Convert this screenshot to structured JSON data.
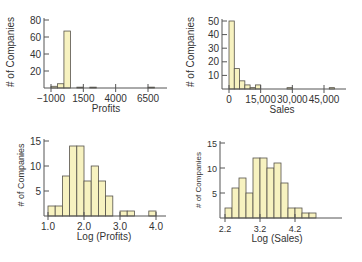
{
  "style": {
    "bar_fill": "#f7f2c0",
    "bar_stroke": "#55524a",
    "axis_color": "#555555",
    "text_color": "#333333"
  },
  "chart_data": [
    {
      "id": "profits",
      "type": "bar",
      "subtype": "histogram",
      "title": "",
      "xlabel": "Profits",
      "ylabel": "# of Companies",
      "xticks": [
        -1000,
        1500,
        4000,
        6500
      ],
      "xtick_labels": [
        "−1000",
        "1500",
        "4000",
        "6500"
      ],
      "yticks": [
        20,
        40,
        60,
        80
      ],
      "ylim": [
        0,
        80
      ],
      "xlim": [
        -1200,
        7300
      ],
      "bin_width": 500,
      "bins": [
        {
          "x0": -1000,
          "x1": -500,
          "count": 2
        },
        {
          "x0": -500,
          "x1": 0,
          "count": 5
        },
        {
          "x0": 0,
          "x1": 500,
          "count": 67
        },
        {
          "x0": 1000,
          "x1": 1500,
          "count": 1
        },
        {
          "x0": 2000,
          "x1": 2500,
          "count": 1
        },
        {
          "x0": 6500,
          "x1": 7000,
          "count": 1
        }
      ],
      "grid": false,
      "legend": "none"
    },
    {
      "id": "sales",
      "type": "bar",
      "subtype": "histogram",
      "title": "",
      "xlabel": "Sales",
      "ylabel": "# of Companies",
      "xticks": [
        0,
        15000,
        30000,
        45000
      ],
      "xtick_labels": [
        "0",
        "15,000",
        "30,000",
        "45,000"
      ],
      "yticks": [
        10,
        20,
        30,
        40,
        50
      ],
      "ylim": [
        0,
        50
      ],
      "xlim": [
        -1500,
        52000
      ],
      "bin_width": 2500,
      "bins": [
        {
          "x0": 0,
          "x1": 2500,
          "count": 50
        },
        {
          "x0": 2500,
          "x1": 5000,
          "count": 15
        },
        {
          "x0": 5000,
          "x1": 7500,
          "count": 6
        },
        {
          "x0": 7500,
          "x1": 10000,
          "count": 3
        },
        {
          "x0": 10000,
          "x1": 12500,
          "count": 1
        },
        {
          "x0": 12500,
          "x1": 15000,
          "count": 3
        },
        {
          "x0": 27500,
          "x1": 30000,
          "count": 1
        },
        {
          "x0": 47500,
          "x1": 50000,
          "count": 1
        }
      ],
      "grid": false,
      "legend": "none"
    },
    {
      "id": "log-profits",
      "type": "bar",
      "subtype": "histogram",
      "title": "",
      "xlabel": "Log (Profits)",
      "ylabel": "# of Companies",
      "xticks": [
        1.0,
        2.0,
        3.0,
        4.0
      ],
      "xtick_labels": [
        "1.0",
        "2.0",
        "3.0",
        "4.0"
      ],
      "yticks": [
        5,
        10,
        15
      ],
      "ylim": [
        0,
        15
      ],
      "xlim": [
        0.9,
        4.1
      ],
      "bin_width": 0.2,
      "bins": [
        {
          "x0": 1.0,
          "x1": 1.2,
          "count": 2
        },
        {
          "x0": 1.2,
          "x1": 1.4,
          "count": 2
        },
        {
          "x0": 1.4,
          "x1": 1.6,
          "count": 8
        },
        {
          "x0": 1.6,
          "x1": 1.8,
          "count": 14
        },
        {
          "x0": 1.8,
          "x1": 2.0,
          "count": 14
        },
        {
          "x0": 2.0,
          "x1": 2.2,
          "count": 7
        },
        {
          "x0": 2.2,
          "x1": 2.4,
          "count": 10
        },
        {
          "x0": 2.4,
          "x1": 2.6,
          "count": 7
        },
        {
          "x0": 2.6,
          "x1": 2.8,
          "count": 4
        },
        {
          "x0": 3.0,
          "x1": 3.2,
          "count": 1
        },
        {
          "x0": 3.2,
          "x1": 3.4,
          "count": 1
        },
        {
          "x0": 3.8,
          "x1": 4.0,
          "count": 1
        }
      ],
      "grid": false,
      "legend": "none"
    },
    {
      "id": "log-sales",
      "type": "bar",
      "subtype": "histogram",
      "title": "",
      "xlabel": "Log (Sales)",
      "ylabel": "# of Companies",
      "xticks": [
        2.2,
        3.2,
        4.2
      ],
      "xtick_labels": [
        "2.2",
        "3.2",
        "4.2"
      ],
      "yticks": [
        5,
        10,
        15
      ],
      "ylim": [
        0,
        15
      ],
      "xlim": [
        2.15,
        5.2
      ],
      "bin_width": 0.2,
      "bins": [
        {
          "x0": 2.2,
          "x1": 2.4,
          "count": 2
        },
        {
          "x0": 2.4,
          "x1": 2.6,
          "count": 6
        },
        {
          "x0": 2.6,
          "x1": 2.8,
          "count": 8
        },
        {
          "x0": 2.8,
          "x1": 3.0,
          "count": 5
        },
        {
          "x0": 3.0,
          "x1": 3.2,
          "count": 12
        },
        {
          "x0": 3.2,
          "x1": 3.4,
          "count": 12
        },
        {
          "x0": 3.4,
          "x1": 3.6,
          "count": 10
        },
        {
          "x0": 3.6,
          "x1": 3.8,
          "count": 11
        },
        {
          "x0": 3.8,
          "x1": 4.0,
          "count": 7
        },
        {
          "x0": 4.0,
          "x1": 4.2,
          "count": 2
        },
        {
          "x0": 4.2,
          "x1": 4.4,
          "count": 2
        },
        {
          "x0": 4.4,
          "x1": 4.6,
          "count": 1
        },
        {
          "x0": 4.6,
          "x1": 4.8,
          "count": 1
        }
      ],
      "grid": false,
      "legend": "none"
    }
  ],
  "layout": [
    {
      "axis_x": 44,
      "axis_right": 167,
      "base_y": 88,
      "top_y": 20,
      "x_px": [
        51,
        148
      ],
      "x_val": [
        -1000,
        6500
      ],
      "ylabel_x": 14,
      "xlabel_y": 112,
      "ticklabel_y": 102,
      "ylabel_cy": 52,
      "xlabel_cx": 106,
      "ylabel_size": 10,
      "tick_size": 10
    },
    {
      "axis_x": 222,
      "axis_right": 346,
      "base_y": 89,
      "top_y": 21,
      "x_px": [
        229,
        324
      ],
      "x_val": [
        0,
        45000
      ],
      "ylabel_x": 194,
      "xlabel_y": 113,
      "ticklabel_y": 103,
      "ylabel_cy": 52,
      "xlabel_cx": 282,
      "ylabel_size": 10,
      "tick_size": 10
    },
    {
      "axis_x": 44,
      "axis_right": 166,
      "base_y": 216,
      "top_y": 141,
      "x_px": [
        48,
        156
      ],
      "x_val": [
        1.0,
        4.0
      ],
      "ylabel_x": 24,
      "xlabel_y": 240,
      "ticklabel_y": 230,
      "ylabel_cy": 175,
      "xlabel_cx": 104,
      "ylabel_size": 9,
      "tick_size": 10
    },
    {
      "axis_x": 220,
      "axis_right": 342,
      "base_y": 218,
      "top_y": 143,
      "x_px": [
        225,
        295
      ],
      "x_val": [
        2.2,
        4.2
      ],
      "ylabel_x": 201,
      "xlabel_y": 242,
      "ticklabel_y": 232,
      "ylabel_cy": 180,
      "xlabel_cx": 277,
      "ylabel_size": 8,
      "tick_size": 9
    }
  ]
}
